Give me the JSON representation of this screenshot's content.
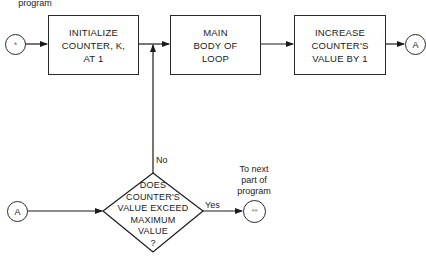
{
  "diagram": {
    "type": "flowchart",
    "top_label": "program",
    "start_connector": {
      "symbol": "*"
    },
    "boxes": [
      {
        "id": "init",
        "text": "INITIALIZE\nCOUNTER, K,\nAT 1"
      },
      {
        "id": "body",
        "text": "MAIN\nBODY OF\nLOOP"
      },
      {
        "id": "increase",
        "text": "INCREASE\nCOUNTER'S\nVALUE BY 1"
      }
    ],
    "off_page_connector_out": {
      "symbol": "A"
    },
    "off_page_connector_in": {
      "symbol": "A"
    },
    "decision": {
      "text": "DOES\nCOUNTER'S\nVALUE EXCEED\nMAXIMUM\nVALUE\n?",
      "no_label": "No",
      "yes_label": "Yes"
    },
    "end_connector": {
      "symbol": "**"
    },
    "end_label": "To next\npart of\nprogram"
  }
}
